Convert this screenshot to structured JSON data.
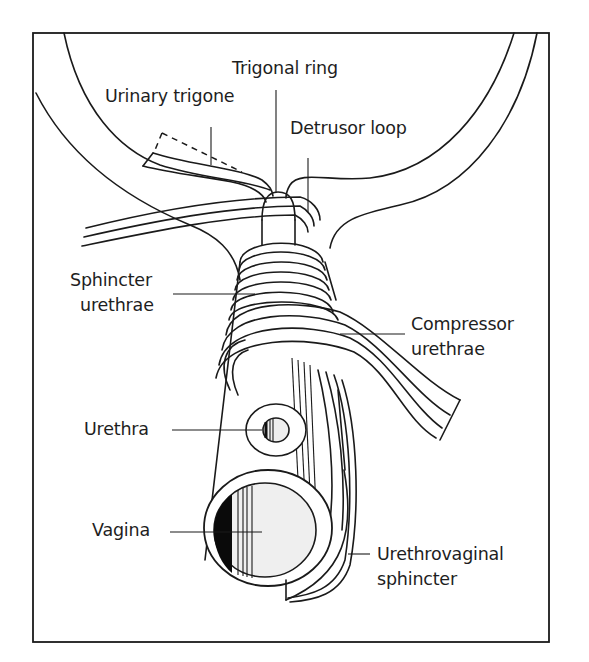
{
  "figure": {
    "labels": {
      "trigonal_ring": "Trigonal ring",
      "urinary_trigone": "Urinary trigone",
      "detrusor_loop": "Detrusor loop",
      "sphincter_urethrae_line1": "Sphincter",
      "sphincter_urethrae_line2": "urethrae",
      "compressor_urethrae_line1": "Compressor",
      "compressor_urethrae_line2": "urethrae",
      "urethra": "Urethra",
      "vagina": "Vagina",
      "urethrovaginal_line1": "Urethrovaginal",
      "urethrovaginal_line2": "sphincter"
    },
    "colors": {
      "line": "#1a1a1a",
      "background": "#ffffff",
      "lumen_fill": "#efefef",
      "shadow_fill": "#0a0a0a"
    }
  }
}
